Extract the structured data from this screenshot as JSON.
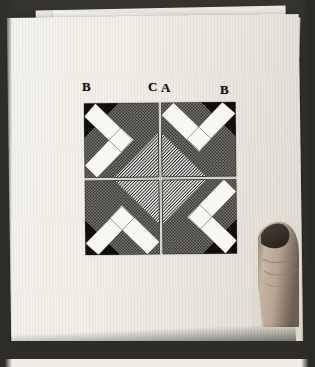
{
  "scene": {
    "description": "photograph-of-printed-figure-held-by-hand",
    "background_color": "#35332d",
    "card_color": "#f2f0ea",
    "ink_color": "#15130f"
  },
  "labels": [
    {
      "text": "B",
      "name": "label-b-left"
    },
    {
      "text": "C",
      "name": "label-c"
    },
    {
      "text": "A",
      "name": "label-a"
    },
    {
      "text": "B",
      "name": "label-b-right"
    }
  ],
  "figure": {
    "name": "optical-illusion-tile-figure",
    "tiles": 4,
    "arrangement": "2x2-rotational",
    "elements": {
      "white_band": "#f6f5f0",
      "dark_stipple": "#4a4843",
      "solid_black": "#0e0d0b",
      "hatch_fill": "#8c8a85"
    }
  },
  "hand": {
    "name": "pointing-finger",
    "skin_color": "#b9a798"
  }
}
